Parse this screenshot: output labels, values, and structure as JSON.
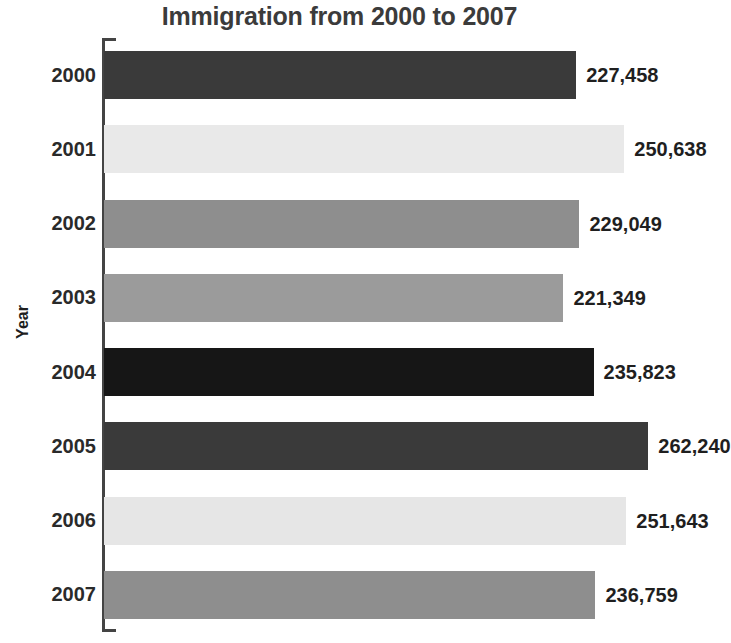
{
  "chart_data": {
    "type": "bar",
    "orientation": "horizontal",
    "title": "Immigration from 2000 to 2007",
    "xlabel": "",
    "ylabel": "Year",
    "categories": [
      "2000",
      "2001",
      "2002",
      "2003",
      "2004",
      "2005",
      "2006",
      "2007"
    ],
    "values": [
      227458,
      250638,
      229049,
      221349,
      235823,
      262240,
      251643,
      236759
    ],
    "value_labels": [
      "227,458",
      "250,638",
      "229,049",
      "221,349",
      "235,823",
      "262,240",
      "251,643",
      "236,759"
    ],
    "bar_colors": [
      "#3a3a3a",
      "#e9e9e9",
      "#8e8e8e",
      "#9b9b9b",
      "#161616",
      "#3a3a3a",
      "#e6e6e6",
      "#8e8e8e"
    ],
    "xlim": [
      0,
      277000
    ],
    "grid": false,
    "legend": false,
    "axis_color": "#444444",
    "title_color": "#3b3b3b",
    "text_color": "#1f1f1f",
    "background": "#ffffff"
  }
}
